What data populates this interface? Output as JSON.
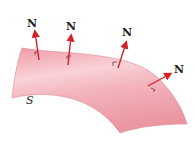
{
  "diagram": {
    "surface_label": "S",
    "normal_label": "N",
    "colors": {
      "surface_fill": "#f0a8b0",
      "surface_highlight": "#f9d4d8",
      "surface_edge": "#d98a94",
      "arrow": "#d6202b",
      "text": "#1a1a1a"
    },
    "normals": [
      {
        "label": "N"
      },
      {
        "label": "N"
      },
      {
        "label": "N"
      },
      {
        "label": "N"
      }
    ]
  }
}
